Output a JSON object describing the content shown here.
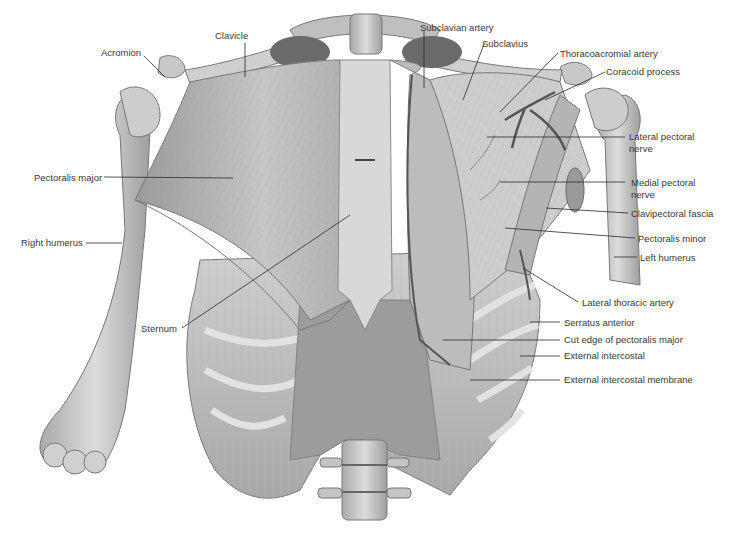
{
  "figure": {
    "colors": {
      "background": "#ffffff",
      "bone": "#d6d6d6",
      "bone_shade": "#a8a8a8",
      "muscle": "#bdbdbd",
      "muscle_dark": "#8e8e8e",
      "label_text": "#3a3a3a",
      "leader_line": "#2a2a2a",
      "vessel": "#555555"
    }
  },
  "labels": {
    "acromion": "Acromion",
    "clavicle": "Clavicle",
    "subclavian_artery": "Subclavian artery",
    "subclavius": "Subclavius",
    "thoracoacromial_artery": "Thoracoacromial artery",
    "coracoid_process": "Coracoid process",
    "lateral_pectoral_nerve_1": "Lateral pectoral",
    "lateral_pectoral_nerve_2": "nerve",
    "medial_pectoral_nerve_1": "Medial pectoral",
    "medial_pectoral_nerve_2": "nerve",
    "clavipectoral_fascia": "Clavipectoral fascia",
    "pectoralis_minor": "Pectoralis minor",
    "left_humerus": "Left humerus",
    "pectoralis_major": "Pectoralis major",
    "right_humerus": "Right humerus",
    "sternum": "Sternum",
    "lateral_thoracic_artery": "Lateral thoracic artery",
    "serratus_anterior": "Serratus anterior",
    "cut_edge_pectoralis_major": "Cut edge of pectoralis major",
    "external_intercostal": "External intercostal",
    "external_intercostal_membrane": "External intercostal membrane"
  }
}
